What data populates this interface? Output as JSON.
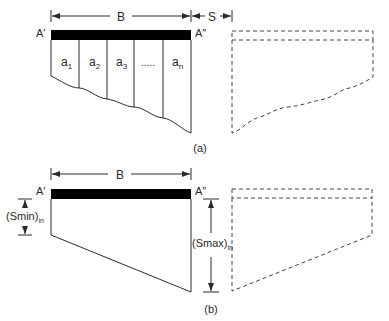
{
  "figure_a": {
    "width_label": "B",
    "spacing_label": "S",
    "left_edge_label": "A′",
    "right_edge_label": "A″",
    "strips": [
      {
        "base": "a",
        "sub": "1"
      },
      {
        "base": "a",
        "sub": "2"
      },
      {
        "base": "a",
        "sub": "3"
      },
      {
        "base": ".....",
        "sub": ""
      },
      {
        "base": "a",
        "sub": "n"
      }
    ],
    "caption": "(a)"
  },
  "figure_b": {
    "width_label": "B",
    "left_edge_label": "A′",
    "right_edge_label": "A″",
    "min_settlement_label": {
      "base": "(Smin)",
      "sub": "in"
    },
    "max_settlement_label": {
      "base": "(Smax)",
      "sub": "in"
    },
    "caption": "(b)"
  },
  "colors": {
    "line": "#2a2a2a",
    "footing": "#000000",
    "dashed": "#444444"
  }
}
